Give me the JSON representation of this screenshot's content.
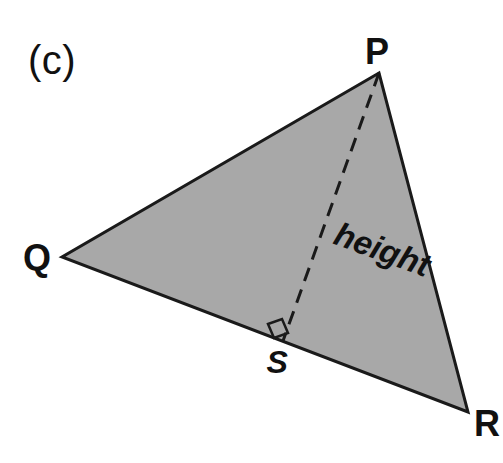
{
  "figure": {
    "part_label": "(c)",
    "height_label": "height",
    "fill_color": "#a8a8a8",
    "stroke_color": "#1a1a1a",
    "background_color": "#ffffff",
    "vertices": [
      {
        "name": "P",
        "label": "P",
        "x": 379,
        "y": 73,
        "label_x": 377,
        "label_y": 52,
        "style": "upright"
      },
      {
        "name": "Q",
        "label": "Q",
        "x": 62,
        "y": 257,
        "label_x": 37,
        "label_y": 258,
        "style": "upright"
      },
      {
        "name": "R",
        "label": "R",
        "x": 468,
        "y": 412,
        "label_x": 487,
        "label_y": 424,
        "style": "upright"
      },
      {
        "name": "S",
        "label": "S",
        "x": 283,
        "y": 341,
        "label_x": 277,
        "label_y": 362,
        "style": "italic"
      }
    ],
    "altitude": {
      "from": "P",
      "to": "S",
      "line_style": "dashed",
      "right_angle_at": "S"
    },
    "triangle_path": "M 379 73 L 62 257 L 468 412 Z",
    "altitude_path": "M 379 73 L 283 341",
    "right_angle_path": "M 268 324 L 282 319 L 288 333 L 274 338 Z",
    "height_label_x": 336,
    "height_label_y": 216,
    "height_label_rotation": 20
  }
}
